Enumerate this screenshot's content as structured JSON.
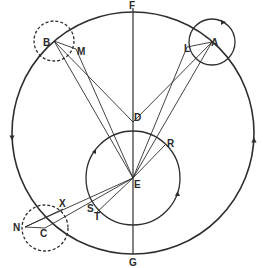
{
  "diagram": {
    "type": "geometric-astronomy-diagram",
    "colors": {
      "ink": "#2e2e2e",
      "background": "#ffffff"
    },
    "deferent": {
      "cx": 133,
      "cy": 133,
      "r": 121,
      "arrows": [
        {
          "x": 12,
          "y": 138,
          "dir": "down"
        },
        {
          "x": 254,
          "y": 140,
          "dir": "up"
        }
      ]
    },
    "inner_circle": {
      "cx": 133,
      "cy": 178,
      "r": 47
    },
    "vertical_axis": {
      "x": 133,
      "y1": 8,
      "y2": 254
    },
    "epicycles": [
      {
        "name": "B",
        "cx": 54,
        "cy": 41,
        "r": 20,
        "dashed": true
      },
      {
        "name": "A",
        "cx": 212,
        "cy": 42,
        "r": 23,
        "dashed": false
      },
      {
        "name": "C",
        "cx": 45,
        "cy": 228,
        "r": 23,
        "dashed": true
      }
    ],
    "points": {
      "F": {
        "x": 133,
        "y": 8,
        "label": "F",
        "lx": 129,
        "ly": 9
      },
      "G": {
        "x": 133,
        "y": 254,
        "label": "G",
        "lx": 129,
        "ly": 266
      },
      "D": {
        "x": 133,
        "y": 122,
        "label": "D",
        "lx": 134,
        "ly": 121
      },
      "E": {
        "x": 133,
        "y": 178,
        "label": "E",
        "lx": 134,
        "ly": 188
      },
      "B": {
        "x": 54,
        "y": 41,
        "label": "B",
        "lx": 43,
        "ly": 46
      },
      "A": {
        "x": 212,
        "y": 42,
        "label": "A",
        "lx": 211,
        "ly": 46
      },
      "C": {
        "x": 45,
        "y": 228,
        "label": "C",
        "lx": 40,
        "ly": 237
      },
      "M": {
        "x": 76,
        "y": 49,
        "label": "M",
        "lx": 77,
        "ly": 55
      },
      "L": {
        "x": 187,
        "y": 47,
        "label": "L",
        "lx": 184,
        "ly": 52
      },
      "N": {
        "x": 25,
        "y": 227,
        "label": "N",
        "lx": 13,
        "ly": 231
      },
      "X": {
        "x": 63,
        "y": 209,
        "label": "X",
        "lx": 59,
        "ly": 207
      },
      "S": {
        "x": 91,
        "y": 207,
        "label": "S",
        "lx": 87,
        "ly": 212
      },
      "T": {
        "x": 96,
        "y": 213,
        "label": "T",
        "lx": 94,
        "ly": 220
      },
      "R": {
        "x": 165,
        "y": 145,
        "label": "R",
        "lx": 167,
        "ly": 147
      }
    },
    "lines": [
      [
        "B",
        "M"
      ],
      [
        "B",
        "D"
      ],
      [
        "B",
        "E"
      ],
      [
        "M",
        "E"
      ],
      [
        "A",
        "L"
      ],
      [
        "A",
        "D"
      ],
      [
        "A",
        "E"
      ],
      [
        "L",
        "E"
      ],
      [
        "N",
        "C"
      ],
      [
        "N",
        "E"
      ],
      [
        "C",
        "E"
      ],
      [
        "N",
        "X"
      ],
      [
        "E",
        "T"
      ],
      [
        "E",
        "R"
      ]
    ]
  }
}
